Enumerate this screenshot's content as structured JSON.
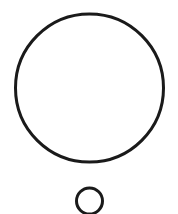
{
  "diagram": {
    "background": "#ffffff",
    "stroke_color": "#1a1a1a",
    "shapes": [
      {
        "name": "large-circle",
        "type": "circle",
        "cx": 89.5,
        "cy": 88,
        "r": 74,
        "stroke_width": 3,
        "fill": "none"
      },
      {
        "name": "small-circle",
        "type": "circle",
        "cx": 89.5,
        "cy": 201,
        "r": 13,
        "stroke_width": 3,
        "fill": "none"
      }
    ]
  }
}
